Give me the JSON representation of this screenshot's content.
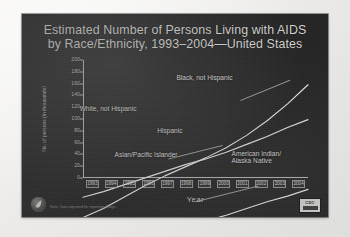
{
  "slide": {
    "title_line1": "Estimated Number of Persons Living with AIDS",
    "title_line2": "by Race/Ethnicity, 1993–2004—United States",
    "note": "Note: Data adjusted for reporting delays.",
    "logo_hhs_name": "hhs-eagle-logo",
    "badge_line1": "CDC",
    "colors": {
      "slide_background": "#242424",
      "page_background": "#efeeec",
      "text": "#d8d8d6",
      "axis": "#bdbdbb",
      "series_line": "#f0f0ee"
    }
  },
  "chart_data": {
    "type": "line",
    "title": "Estimated Number of Persons Living with AIDS by Race/Ethnicity, 1993–2004—United States",
    "xlabel": "Year",
    "ylabel": "No. of persons (in thousands)",
    "x": [
      1993,
      1994,
      1995,
      1996,
      1997,
      1998,
      1999,
      2000,
      2001,
      2002,
      2003,
      2004
    ],
    "xtick_labels": [
      "1993",
      "1994",
      "1995",
      "1996",
      "1997",
      "1998",
      "1999",
      "2000",
      "2001",
      "2002",
      "2003",
      "2004"
    ],
    "ylim": [
      0,
      200
    ],
    "ytick_labels": [
      "0",
      "20",
      "40",
      "60",
      "80",
      "100",
      "120",
      "140",
      "160",
      "180",
      "200"
    ],
    "ytick_values": [
      0,
      20,
      40,
      60,
      80,
      100,
      120,
      140,
      160,
      180,
      200
    ],
    "grid": false,
    "legend": "inline-labels",
    "series": [
      {
        "name": "Black, not Hispanic",
        "label": "Black, not Hispanic",
        "values": [
          60,
          68,
          78,
          88,
          97,
          105,
          113,
          122,
          133,
          146,
          161,
          178
        ]
      },
      {
        "name": "White, not Hispanic",
        "label": "White, not Hispanic",
        "values": [
          78,
          83,
          89,
          95,
          101,
          107,
          112,
          118,
          125,
          132,
          140,
          147
        ]
      },
      {
        "name": "Hispanic",
        "label": "Hispanic",
        "values": [
          30,
          33,
          37,
          42,
          47,
          52,
          57,
          62,
          68,
          74,
          79,
          85
        ]
      },
      {
        "name": "Asian/Pacific Islander",
        "label": "Asian/Pacific Islander",
        "values": [
          2,
          2,
          3,
          3,
          3,
          4,
          4,
          4,
          5,
          5,
          6,
          6
        ]
      },
      {
        "name": "American Indian/Alaska Native",
        "label_line1": "American Indian/",
        "label_line2": "Alaska Native",
        "values": [
          1,
          1,
          1,
          1,
          1,
          2,
          2,
          2,
          2,
          2,
          3,
          3
        ]
      }
    ]
  }
}
